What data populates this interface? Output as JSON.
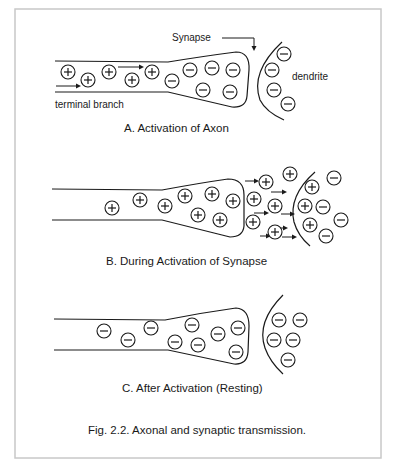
{
  "figure": {
    "caption": "Fig. 2.2. Axonal and synaptic transmission."
  },
  "panels": [
    {
      "id": "A",
      "title": "A. Activation of Axon",
      "labels": {
        "synapse": "Synapse",
        "dendrite": "dendrite",
        "terminal_branch": "terminal branch"
      },
      "axon_ions": [
        {
          "charge": "+",
          "n": 1
        },
        {
          "charge": "+",
          "n": 2
        },
        {
          "charge": "+",
          "n": 3
        },
        {
          "charge": "+",
          "n": 4
        },
        {
          "charge": "+",
          "n": 5
        },
        {
          "charge": "-",
          "n": 6
        },
        {
          "charge": "-",
          "n": 7
        },
        {
          "charge": "-",
          "n": 8
        },
        {
          "charge": "-",
          "n": 9
        },
        {
          "charge": "-",
          "n": 10
        },
        {
          "charge": "-",
          "n": 11
        }
      ],
      "dendrite_ions": [
        {
          "charge": "-"
        },
        {
          "charge": "-"
        },
        {
          "charge": "-"
        },
        {
          "charge": "-"
        }
      ]
    },
    {
      "id": "B",
      "title": "B. During Activation of Synapse",
      "axon_ions": [
        {
          "charge": "+"
        },
        {
          "charge": "+"
        },
        {
          "charge": "+"
        },
        {
          "charge": "+"
        },
        {
          "charge": "+"
        },
        {
          "charge": "+"
        },
        {
          "charge": "+"
        },
        {
          "charge": "+"
        }
      ],
      "cleft_ions": [
        {
          "charge": "+"
        },
        {
          "charge": "+"
        },
        {
          "charge": "+"
        },
        {
          "charge": "+"
        },
        {
          "charge": "+"
        },
        {
          "charge": "+"
        }
      ],
      "dendrite_ions": [
        {
          "charge": "+"
        },
        {
          "charge": "+"
        },
        {
          "charge": "+"
        },
        {
          "charge": "-"
        },
        {
          "charge": "-"
        },
        {
          "charge": "-"
        },
        {
          "charge": "-"
        }
      ]
    },
    {
      "id": "C",
      "title": "C. After Activation (Resting)",
      "axon_ions": [
        {
          "charge": "-"
        },
        {
          "charge": "-"
        },
        {
          "charge": "-"
        },
        {
          "charge": "-"
        },
        {
          "charge": "-"
        },
        {
          "charge": "-"
        },
        {
          "charge": "-"
        },
        {
          "charge": "-"
        },
        {
          "charge": "-"
        }
      ],
      "dendrite_ions": [
        {
          "charge": "-"
        },
        {
          "charge": "-"
        },
        {
          "charge": "-"
        },
        {
          "charge": "-"
        },
        {
          "charge": "-"
        }
      ]
    }
  ]
}
